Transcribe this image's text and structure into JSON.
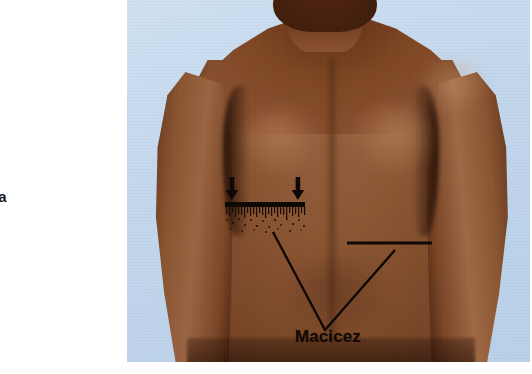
{
  "page": {
    "kind": "anatomical-photograph-plate",
    "width": 532,
    "height": 374,
    "background_color": "#ffffff"
  },
  "caption": {
    "margin_text": "ia"
  },
  "photo": {
    "subject": "posterior thorax of a male patient, viewed from behind",
    "backdrop_color": "#c6d9ef",
    "skin_midtone_color": "#8b5633",
    "skin_shadow_color": "#4a2410",
    "skin_highlight_color": "#a97049",
    "annotation_color": "#0d0603"
  },
  "annotations": {
    "label": "Macicez",
    "arrows": [
      {
        "name": "arrow-left",
        "direction": "down",
        "x": 105,
        "y_top": 178,
        "y_tip": 199
      },
      {
        "name": "arrow-right",
        "direction": "down",
        "x": 171,
        "y_top": 178,
        "y_tip": 199
      }
    ],
    "bar": {
      "name": "percussion-bar",
      "x1": 98,
      "y1": 204,
      "x2": 178,
      "y2": 204
    },
    "stipple_zone": {
      "name": "stipple-shading",
      "x": 98,
      "y": 206,
      "width": 80,
      "height": 26
    },
    "rule": {
      "name": "reference-rule",
      "x1": 220,
      "y1": 243,
      "x2": 305,
      "y2": 243
    },
    "vee": {
      "name": "dullness-outline",
      "points": "146,232 198,330 268,250"
    }
  }
}
